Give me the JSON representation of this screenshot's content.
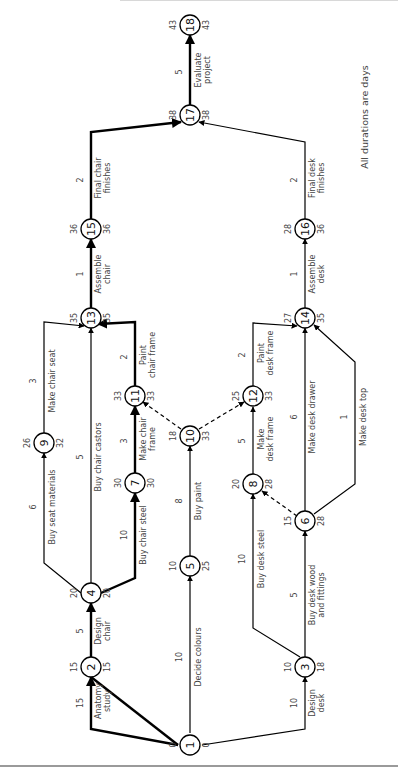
{
  "diagram": {
    "type": "activity-on-arrow network (critical path analysis)",
    "orientation": "rotated 90 degrees counter-clockwise",
    "note": "All durations are days",
    "colors": {
      "line": "#000000",
      "text": "#444444",
      "background": "#ffffff"
    },
    "nodes": [
      {
        "id": "1",
        "label": "1",
        "earliest": "0",
        "latest": "0"
      },
      {
        "id": "2",
        "label": "2",
        "earliest": "15",
        "latest": "15"
      },
      {
        "id": "3",
        "label": "3",
        "earliest": "10",
        "latest": "18"
      },
      {
        "id": "4",
        "label": "4",
        "earliest": "20",
        "latest": "20"
      },
      {
        "id": "5",
        "label": "5",
        "earliest": "10",
        "latest": "25"
      },
      {
        "id": "6",
        "label": "6",
        "earliest": "15",
        "latest": "28"
      },
      {
        "id": "7",
        "label": "7",
        "earliest": "30",
        "latest": "30"
      },
      {
        "id": "8",
        "label": "8",
        "earliest": "20",
        "latest": "28"
      },
      {
        "id": "9",
        "label": "9",
        "earliest": "26",
        "latest": "32"
      },
      {
        "id": "10",
        "label": "10",
        "earliest": "18",
        "latest": "33"
      },
      {
        "id": "11",
        "label": "11",
        "earliest": "33",
        "latest": "33"
      },
      {
        "id": "12",
        "label": "12",
        "earliest": "25",
        "latest": "33"
      },
      {
        "id": "13",
        "label": "13",
        "earliest": "35",
        "latest": "35"
      },
      {
        "id": "14",
        "label": "14",
        "earliest": "27",
        "latest": "35"
      },
      {
        "id": "15",
        "label": "15",
        "earliest": "36",
        "latest": "36"
      },
      {
        "id": "16",
        "label": "16",
        "earliest": "28",
        "latest": "36"
      },
      {
        "id": "17",
        "label": "17",
        "earliest": "38",
        "latest": "38"
      },
      {
        "id": "18",
        "label": "18",
        "earliest": "43",
        "latest": "43"
      }
    ],
    "activities": [
      {
        "from": "1",
        "to": "2",
        "name": "Anatomy study",
        "name_l1": "Anatomy",
        "name_l2": "study",
        "duration": "15",
        "critical": true,
        "dummy": false
      },
      {
        "from": "2",
        "to": "4",
        "name": "Design chair",
        "name_l1": "Design",
        "name_l2": "chair",
        "duration": "5",
        "critical": true,
        "dummy": false
      },
      {
        "from": "1",
        "to": "5",
        "name": "Decide colours",
        "name_l1": "Decide colours",
        "name_l2": "",
        "duration": "10",
        "critical": false,
        "dummy": false
      },
      {
        "from": "1",
        "to": "3",
        "name": "Design desk",
        "name_l1": "Design",
        "name_l2": "desk",
        "duration": "10",
        "critical": false,
        "dummy": false
      },
      {
        "from": "4",
        "to": "9",
        "name": "Buy seat materials",
        "name_l1": "Buy seat materials",
        "name_l2": "",
        "duration": "6",
        "critical": false,
        "dummy": false
      },
      {
        "from": "4",
        "to": "13",
        "name": "Buy chair castors",
        "name_l1": "Buy chair castors",
        "name_l2": "",
        "duration": "5",
        "critical": false,
        "dummy": false
      },
      {
        "from": "4",
        "to": "7",
        "name": "Buy chair steel",
        "name_l1": "Buy chair steel",
        "name_l2": "",
        "duration": "10",
        "critical": true,
        "dummy": false
      },
      {
        "from": "9",
        "to": "13",
        "name": "Make chair seat",
        "name_l1": "Make chair seat",
        "name_l2": "",
        "duration": "3",
        "critical": false,
        "dummy": false
      },
      {
        "from": "7",
        "to": "11",
        "name": "Make chair frame",
        "name_l1": "Make chair",
        "name_l2": "frame",
        "duration": "3",
        "critical": true,
        "dummy": false
      },
      {
        "from": "5",
        "to": "10",
        "name": "Buy paint",
        "name_l1": "Buy paint",
        "name_l2": "",
        "duration": "8",
        "critical": false,
        "dummy": false
      },
      {
        "from": "10",
        "to": "11",
        "name": "",
        "name_l1": "",
        "name_l2": "",
        "duration": "",
        "critical": false,
        "dummy": true
      },
      {
        "from": "10",
        "to": "12",
        "name": "",
        "name_l1": "",
        "name_l2": "",
        "duration": "",
        "critical": false,
        "dummy": true
      },
      {
        "from": "11",
        "to": "13",
        "name": "Paint chair frame",
        "name_l1": "Paint",
        "name_l2": "chair frame",
        "duration": "2",
        "critical": true,
        "dummy": false
      },
      {
        "from": "3",
        "to": "8",
        "name": "Buy desk steel",
        "name_l1": "Buy desk steel",
        "name_l2": "",
        "duration": "10",
        "critical": false,
        "dummy": false
      },
      {
        "from": "3",
        "to": "6",
        "name": "Buy desk wood and fittings",
        "name_l1": "Buy desk wood",
        "name_l2": "and fittings",
        "duration": "5",
        "critical": false,
        "dummy": false
      },
      {
        "from": "6",
        "to": "8",
        "name": "",
        "name_l1": "",
        "name_l2": "",
        "duration": "",
        "critical": false,
        "dummy": true
      },
      {
        "from": "8",
        "to": "12",
        "name": "Make desk frame",
        "name_l1": "Make",
        "name_l2": "desk frame",
        "duration": "5",
        "critical": false,
        "dummy": false
      },
      {
        "from": "6",
        "to": "14",
        "name": "Make desk drawer",
        "name_l1": "Make desk drawer",
        "name_l2": "",
        "duration": "6",
        "critical": false,
        "dummy": false
      },
      {
        "from": "6",
        "to": "14",
        "name": "Make desk top",
        "name_l1": "Make desk top",
        "name_l2": "",
        "duration": "1",
        "critical": false,
        "dummy": false
      },
      {
        "from": "12",
        "to": "14",
        "name": "Paint desk frame",
        "name_l1": "Paint",
        "name_l2": "desk frame",
        "duration": "2",
        "critical": false,
        "dummy": false
      },
      {
        "from": "13",
        "to": "15",
        "name": "Assemble chair",
        "name_l1": "Assemble",
        "name_l2": "chair",
        "duration": "1",
        "critical": true,
        "dummy": false
      },
      {
        "from": "14",
        "to": "16",
        "name": "Assemble desk",
        "name_l1": "Assemble",
        "name_l2": "desk",
        "duration": "1",
        "critical": false,
        "dummy": false
      },
      {
        "from": "15",
        "to": "17",
        "name": "Final chair finishes",
        "name_l1": "Final chair",
        "name_l2": "finishes",
        "duration": "2",
        "critical": true,
        "dummy": false
      },
      {
        "from": "16",
        "to": "17",
        "name": "Final desk finishes",
        "name_l1": "Final desk",
        "name_l2": "finishes",
        "duration": "2",
        "critical": false,
        "dummy": false
      },
      {
        "from": "17",
        "to": "18",
        "name": "Evaluate project",
        "name_l1": "Evaluate",
        "name_l2": "project",
        "duration": "5",
        "critical": true,
        "dummy": false
      }
    ]
  }
}
